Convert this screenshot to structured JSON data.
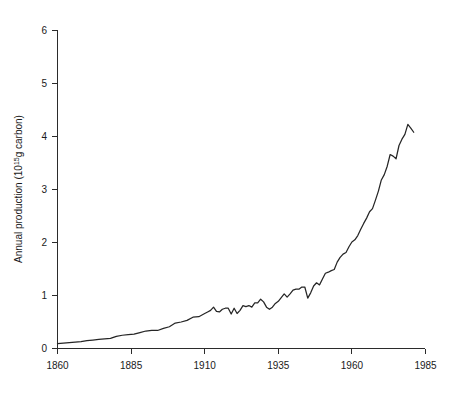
{
  "chart_data": {
    "type": "line",
    "title": "",
    "subtitle": "",
    "xlabel": "",
    "ylabel": "Annual production (10¹⁵g carbon)",
    "ylabel_parts": {
      "pre": "Annual production (10",
      "sup": "15",
      "post": "g carbon)"
    },
    "xlim": [
      1860,
      1985
    ],
    "ylim": [
      0,
      6
    ],
    "xticks": [
      1860,
      1885,
      1910,
      1935,
      1960,
      1985
    ],
    "xticklabels": [
      "1860",
      "1885",
      "1910",
      "1935",
      "1960",
      "1985"
    ],
    "yticks": [
      0,
      1,
      2,
      3,
      4,
      5,
      6
    ],
    "yticklabels": [
      "0",
      "1",
      "2",
      "3",
      "4",
      "5",
      "6"
    ],
    "grid": false,
    "legend": null,
    "legend_position": "none",
    "line_color": "#262626",
    "series": [
      {
        "name": "Annual CO2 production from fossil fuel",
        "x": [
          1860,
          1862,
          1864,
          1866,
          1868,
          1870,
          1872,
          1874,
          1876,
          1878,
          1880,
          1882,
          1884,
          1886,
          1888,
          1890,
          1892,
          1894,
          1896,
          1898,
          1900,
          1902,
          1904,
          1906,
          1908,
          1910,
          1911,
          1912,
          1913,
          1914,
          1915,
          1916,
          1917,
          1918,
          1919,
          1920,
          1921,
          1922,
          1923,
          1924,
          1925,
          1926,
          1927,
          1928,
          1929,
          1930,
          1931,
          1932,
          1933,
          1934,
          1935,
          1936,
          1937,
          1938,
          1939,
          1940,
          1941,
          1942,
          1943,
          1944,
          1945,
          1946,
          1947,
          1948,
          1949,
          1950,
          1951,
          1952,
          1953,
          1954,
          1955,
          1956,
          1957,
          1958,
          1959,
          1960,
          1961,
          1962,
          1963,
          1964,
          1965,
          1966,
          1967,
          1968,
          1969,
          1970,
          1971,
          1972,
          1973,
          1974,
          1975,
          1976,
          1977,
          1978,
          1979,
          1980,
          1981
        ],
        "y": [
          0.09,
          0.1,
          0.11,
          0.12,
          0.13,
          0.15,
          0.16,
          0.17,
          0.18,
          0.19,
          0.23,
          0.25,
          0.26,
          0.27,
          0.3,
          0.33,
          0.34,
          0.34,
          0.38,
          0.41,
          0.48,
          0.5,
          0.53,
          0.59,
          0.6,
          0.66,
          0.69,
          0.72,
          0.78,
          0.7,
          0.69,
          0.74,
          0.76,
          0.76,
          0.65,
          0.76,
          0.66,
          0.72,
          0.81,
          0.79,
          0.81,
          0.78,
          0.86,
          0.86,
          0.93,
          0.88,
          0.78,
          0.74,
          0.78,
          0.85,
          0.89,
          0.96,
          1.03,
          0.97,
          1.03,
          1.1,
          1.12,
          1.12,
          1.16,
          1.16,
          0.95,
          1.05,
          1.18,
          1.24,
          1.2,
          1.31,
          1.42,
          1.44,
          1.47,
          1.49,
          1.63,
          1.72,
          1.78,
          1.81,
          1.92,
          2.01,
          2.05,
          2.13,
          2.25,
          2.36,
          2.46,
          2.58,
          2.64,
          2.8,
          2.97,
          3.18,
          3.28,
          3.44,
          3.66,
          3.63,
          3.58,
          3.83,
          3.95,
          4.04,
          4.23,
          4.16,
          4.08
        ],
        "unit": "10^15 g carbon"
      }
    ],
    "peak": {
      "x": 1979,
      "y": 4.23
    },
    "start": {
      "x": 1860,
      "y": 0.09
    },
    "end": {
      "x": 1981,
      "y": 4.08
    }
  }
}
